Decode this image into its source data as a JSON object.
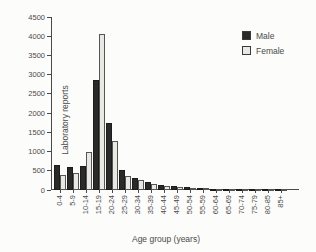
{
  "figure": {
    "background": "#fcfcfa",
    "text_color": "#4a4a4a"
  },
  "chart_data": {
    "type": "bar",
    "title": "",
    "xlabel": "Age group (years)",
    "ylabel": "Laboratory reports",
    "categories": [
      "0-4",
      "5-9",
      "10-14",
      "15-19",
      "20-24",
      "25-29",
      "30-34",
      "35-39",
      "40-44",
      "45-49",
      "50-54",
      "55-59",
      "60-64",
      "65-69",
      "70-74",
      "75-79",
      "80-85",
      "85+"
    ],
    "series": [
      {
        "name": "Male",
        "color": "#2a2a28",
        "border": "#1c1c1c",
        "values": [
          650,
          600,
          620,
          2850,
          1750,
          520,
          320,
          200,
          130,
          100,
          80,
          55,
          35,
          25,
          15,
          10,
          6,
          4
        ]
      },
      {
        "name": "Female",
        "color": "#e9e8e2",
        "border": "#555555",
        "values": [
          390,
          450,
          1000,
          4050,
          1270,
          360,
          250,
          160,
          110,
          85,
          65,
          45,
          26,
          18,
          12,
          8,
          4,
          2
        ]
      }
    ],
    "ylim": [
      0,
      4500
    ],
    "ytick_step": 500,
    "grid": false,
    "legend_position": "top-right"
  }
}
